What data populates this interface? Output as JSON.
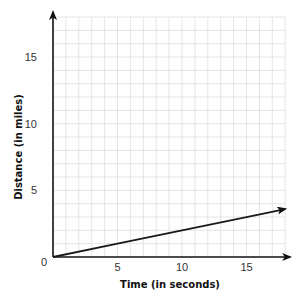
{
  "chart_data": {
    "type": "line",
    "title": "",
    "xlabel": "Time (in seconds)",
    "ylabel": "Distance (in miles)",
    "xlim": [
      0,
      18
    ],
    "ylim": [
      0,
      18
    ],
    "x_ticks": [
      0,
      5,
      10,
      15
    ],
    "y_ticks": [
      0,
      5,
      10,
      15
    ],
    "x_tick_labels": [
      "5",
      "10",
      "15"
    ],
    "y_tick_labels": [
      "5",
      "10",
      "15"
    ],
    "origin_label": "0",
    "grid": true,
    "grid_step": 1,
    "legend": null,
    "series": [
      {
        "name": "distance",
        "x": [
          0,
          5,
          10,
          15,
          18
        ],
        "y": [
          0,
          1,
          2,
          3,
          3.6
        ],
        "arrow_at_end": true
      }
    ],
    "axes_arrows": true
  },
  "colors": {
    "grid": "#dedede",
    "axis": "#111111",
    "line": "#1a1a1a",
    "background": "#ffffff"
  }
}
